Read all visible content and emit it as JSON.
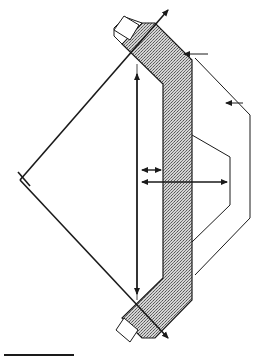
{
  "diagram": {
    "description": "Cross-section of a bent shielded element between two angled lines with dimension arrows",
    "colors": {
      "line": "#1a1a1a",
      "fill_hatch": "#b8b8b8",
      "background": "#ffffff"
    },
    "labels": [],
    "elements": {
      "left_vertex": {
        "x": 20,
        "y": 180
      },
      "top_crossing": {
        "x": 137,
        "y": 64
      },
      "bottom_crossing": {
        "x": 137,
        "y": 300
      },
      "vertical_dimension_arrow": {
        "x": 137,
        "y1": 70,
        "y2": 296
      },
      "short_horizontal_arrow": {
        "x1": 142,
        "x2": 162,
        "y": 170
      },
      "long_horizontal_arrow": {
        "x1": 142,
        "x2": 227,
        "y": 182
      },
      "pointer_arrow_top": {
        "x1": 207,
        "x2": 183,
        "y": 54
      },
      "pointer_arrow_right": {
        "x1": 243,
        "x2": 226,
        "y": 103
      },
      "scale_bar": {
        "x1": 4,
        "x2": 74,
        "y": 355
      }
    }
  }
}
